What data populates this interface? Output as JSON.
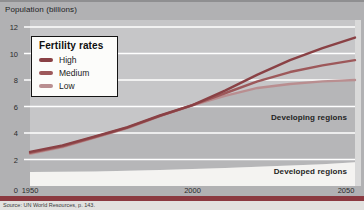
{
  "header": {
    "axis_title": "Population (billions)"
  },
  "legend": {
    "title": "Fertility rates",
    "items": [
      {
        "label": "High",
        "color": "#8a4145"
      },
      {
        "label": "Medium",
        "color": "#9d585a"
      },
      {
        "label": "Low",
        "color": "#b98e90"
      }
    ]
  },
  "annotations": {
    "developing": "Developing regions",
    "developed": "Developed regions"
  },
  "source_note": "Source: UN World Resources, p. 143.",
  "colors": {
    "page_background": "#b1b1b3",
    "plot_background": "#c6c6c8",
    "developing_area": "#b6b6b8",
    "developed_area": "#f4f3f1",
    "gridline": "#ffffff",
    "right_margin": "#d9d9d9",
    "bottom_bar": "#8b3940",
    "tick_text": "#2b2b2b"
  },
  "chart_data": {
    "type": "line",
    "title": "Population (billions)",
    "xlabel": "Year",
    "ylabel": "Population (billions)",
    "xlim": [
      1950,
      2050
    ],
    "ylim": [
      0,
      12
    ],
    "x_ticks": [
      1950,
      2000,
      2050
    ],
    "y_ticks": [
      0,
      2,
      4,
      6,
      8,
      10,
      12
    ],
    "grid": "horizontal white gridlines",
    "legend_position": "upper-left",
    "x": [
      1950,
      1960,
      1970,
      1980,
      1990,
      2000,
      2010,
      2020,
      2030,
      2040,
      2050
    ],
    "series": [
      {
        "name": "High",
        "color": "#8a4145",
        "values": [
          2.5,
          3.0,
          3.7,
          4.4,
          5.3,
          6.1,
          7.2,
          8.4,
          9.5,
          10.4,
          11.2
        ]
      },
      {
        "name": "Medium",
        "color": "#9d585a",
        "values": [
          2.5,
          3.0,
          3.7,
          4.4,
          5.3,
          6.1,
          7.0,
          7.9,
          8.6,
          9.1,
          9.5
        ]
      },
      {
        "name": "Low",
        "color": "#b98e90",
        "values": [
          2.5,
          3.0,
          3.7,
          4.4,
          5.3,
          6.1,
          6.8,
          7.4,
          7.7,
          7.9,
          8.0
        ]
      }
    ],
    "areas": [
      {
        "name": "Developed regions",
        "fill": "#f4f3f1",
        "values": [
          1.05,
          1.08,
          1.1,
          1.15,
          1.2,
          1.28,
          1.35,
          1.45,
          1.55,
          1.65,
          1.8
        ]
      },
      {
        "name": "Developing regions",
        "fill": "#b6b6b8",
        "note": "band between developed-regions total and the Low projection"
      }
    ]
  }
}
